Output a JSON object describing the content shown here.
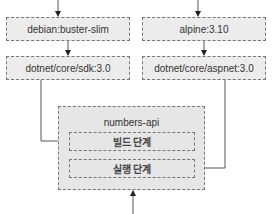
{
  "diagram": {
    "left_column": {
      "base_image": "debian:buster-slim",
      "sdk_image": "dotnet/core/sdk:3.0"
    },
    "right_column": {
      "base_image": "alpine:3.10",
      "runtime_image": "dotnet/core/aspnet:3.0"
    },
    "app": {
      "title": "numbers-api",
      "stages": [
        {
          "label": "빌드 단계"
        },
        {
          "label": "실행 단계"
        }
      ]
    },
    "colors": {
      "box_fill": "#ececec",
      "border": "#777777",
      "line": "#555555"
    }
  }
}
